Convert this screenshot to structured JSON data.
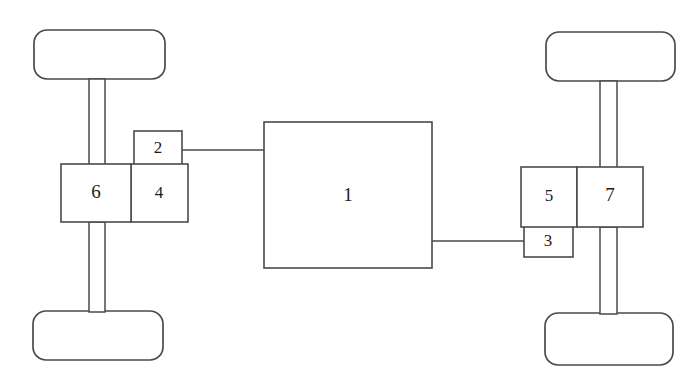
{
  "diagram": {
    "background_color": "#ffffff",
    "line_color": "#4a4a4a",
    "label_color": "#1c1c1c",
    "parts": [
      {
        "id": "part-1",
        "label": "1",
        "name": "central-unit",
        "x": 264,
        "y": 122,
        "w": 168,
        "h": 146,
        "label_x": 348,
        "label_y": 197
      },
      {
        "id": "part-2",
        "label": "2",
        "name": "left-upper-coupling",
        "x": 134,
        "y": 131,
        "w": 48,
        "h": 34,
        "label_x": 158,
        "label_y": 149
      },
      {
        "id": "part-3",
        "label": "3",
        "name": "right-lower-coupling",
        "x": 524,
        "y": 226,
        "w": 49,
        "h": 31,
        "label_x": 548,
        "label_y": 242
      },
      {
        "id": "part-4",
        "label": "4",
        "name": "left-inner-gearbox",
        "x": 131,
        "y": 164,
        "w": 57,
        "h": 58,
        "label_x": 159,
        "label_y": 194
      },
      {
        "id": "part-5",
        "label": "5",
        "name": "right-inner-gearbox",
        "x": 521,
        "y": 167,
        "w": 56,
        "h": 60,
        "label_x": 549,
        "label_y": 197
      },
      {
        "id": "part-6",
        "label": "6",
        "name": "left-outer-gearbox",
        "x": 61,
        "y": 164,
        "w": 70,
        "h": 58,
        "label_x": 96,
        "label_y": 194
      },
      {
        "id": "part-7",
        "label": "7",
        "name": "right-outer-gearbox",
        "x": 577,
        "y": 167,
        "w": 66,
        "h": 60,
        "label_x": 610,
        "label_y": 197
      }
    ],
    "wheels": [
      {
        "id": "wheel-front-left",
        "name": "wheel-front-left",
        "x": 34,
        "y": 30,
        "w": 131,
        "h": 49,
        "r": 13
      },
      {
        "id": "wheel-rear-left",
        "name": "wheel-rear-left",
        "x": 33,
        "y": 311,
        "w": 130,
        "h": 49,
        "r": 13
      },
      {
        "id": "wheel-front-right",
        "name": "wheel-front-right",
        "x": 546,
        "y": 32,
        "w": 129,
        "h": 49,
        "r": 13
      },
      {
        "id": "wheel-rear-right",
        "name": "wheel-rear-right",
        "x": 545,
        "y": 313,
        "w": 128,
        "h": 52,
        "r": 13
      }
    ],
    "axles": [
      {
        "id": "axle-front-left",
        "name": "axle-front-left",
        "x": 89,
        "y": 79,
        "w": 16,
        "h": 86
      },
      {
        "id": "axle-rear-left",
        "name": "axle-rear-left",
        "x": 89,
        "y": 222,
        "w": 16,
        "h": 90
      },
      {
        "id": "axle-front-right",
        "name": "axle-front-right",
        "x": 600,
        "y": 81,
        "w": 17,
        "h": 87
      },
      {
        "id": "axle-rear-right",
        "name": "axle-rear-right",
        "x": 600,
        "y": 227,
        "w": 17,
        "h": 87
      }
    ],
    "connectors": [
      {
        "id": "link-2-to-1",
        "name": "connector-left-upper",
        "from": "part-2",
        "to": "part-1",
        "points": "182,150 264,150"
      },
      {
        "id": "link-1-to-3",
        "name": "connector-right-lower",
        "from": "part-1",
        "to": "part-3",
        "points": "432,241 524,241"
      }
    ]
  }
}
